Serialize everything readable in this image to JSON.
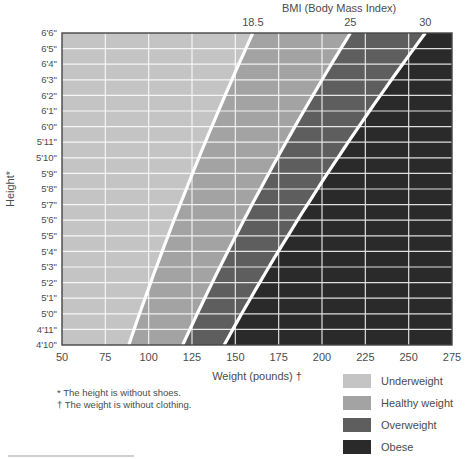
{
  "chart_data": {
    "type": "area",
    "title": "BMI (Body Mass Index)",
    "xlabel": "Weight (pounds) †",
    "ylabel": "Height*",
    "x_tick_labels": [
      50,
      75,
      100,
      125,
      150,
      175,
      200,
      225,
      250,
      275
    ],
    "xlim": [
      50,
      275
    ],
    "y_tick_labels": [
      "6'6\"",
      "6'5\"",
      "6'4\"",
      "6'3\"",
      "6'2\"",
      "6'1\"",
      "6'0\"",
      "5'11\"",
      "5'10\"",
      "5'9\"",
      "5'8\"",
      "5'7\"",
      "5'6\"",
      "5'5\"",
      "5'4\"",
      "5'3\"",
      "5'2\"",
      "5'1\"",
      "5'0\"",
      "4'11\"",
      "4'10\""
    ],
    "bmi_thresholds": [
      18.5,
      25,
      30
    ],
    "regions": [
      {
        "label": "Underweight",
        "bmi_range": "below 18.5",
        "color": "#c4c4c4"
      },
      {
        "label": "Healthy weight",
        "bmi_range": "18.5 to 25",
        "color": "#a3a3a3"
      },
      {
        "label": "Overweight",
        "bmi_range": "25 to 30",
        "color": "#5e5e5e"
      },
      {
        "label": "Obese",
        "bmi_range": "30 and above",
        "color": "#2a2a2a"
      }
    ],
    "grid": true,
    "gridline_color": "#ffffff",
    "boundary_line_color": "#ffffff",
    "legend_position": "bottom-right"
  },
  "legend": [
    {
      "label": "Underweight",
      "color": "#c4c4c4"
    },
    {
      "label": "Healthy weight",
      "color": "#a3a3a3"
    },
    {
      "label": "Overweight",
      "color": "#5e5e5e"
    },
    {
      "label": "Obese",
      "color": "#2a2a2a"
    }
  ],
  "footnotes": [
    "* The height is without shoes.",
    "† The weight is without clothing."
  ]
}
